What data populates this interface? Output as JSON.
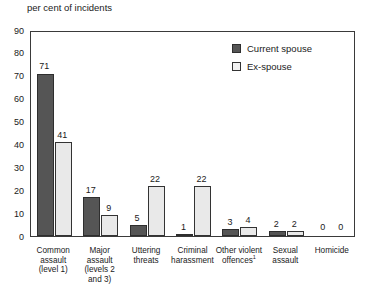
{
  "chart_data": {
    "type": "bar",
    "title": "",
    "ylabel": "per cent of incidents",
    "xlabel": "",
    "ylim": [
      0,
      90
    ],
    "ytick_step": 10,
    "yticks": [
      "0",
      "10",
      "20",
      "30",
      "40",
      "50",
      "60",
      "70",
      "80",
      "90"
    ],
    "grid": false,
    "legend_position": "top-right",
    "categories": [
      "Common assault (level 1)",
      "Major assault (levels 2 and 3)",
      "Uttering threats",
      "Criminal harassment",
      "Other violent offences",
      "Sexual assault",
      "Homicide"
    ],
    "series": [
      {
        "name": "Current spouse",
        "color": "#555555",
        "values": [
          71,
          17,
          5,
          1,
          3,
          2,
          0
        ]
      },
      {
        "name": "Ex-spouse",
        "color": "#e9e9e9",
        "values": [
          41,
          9,
          22,
          22,
          4,
          2,
          0
        ]
      }
    ]
  },
  "axis_title": "per cent of incidents",
  "categories": [
    {
      "lines": [
        "Common",
        "assault",
        "(level 1)"
      ],
      "footnote": ""
    },
    {
      "lines": [
        "Major",
        "assault",
        "(levels 2",
        "and 3)"
      ],
      "footnote": ""
    },
    {
      "lines": [
        "Uttering",
        "threats"
      ],
      "footnote": ""
    },
    {
      "lines": [
        "Criminal",
        "harassment"
      ],
      "footnote": ""
    },
    {
      "lines": [
        "Other violent",
        "offences"
      ],
      "footnote": "1"
    },
    {
      "lines": [
        "Sexual",
        "assault"
      ],
      "footnote": ""
    },
    {
      "lines": [
        "Homicide"
      ],
      "footnote": ""
    }
  ],
  "legend": {
    "items": [
      {
        "label": "Current spouse",
        "key": "current"
      },
      {
        "label": "Ex-spouse",
        "key": "ex"
      }
    ]
  },
  "colors": {
    "current_spouse": "#555555",
    "ex_spouse": "#e9e9e9",
    "axis": "#3a3a3a",
    "text": "#1a1a1a",
    "background": "#ffffff"
  }
}
